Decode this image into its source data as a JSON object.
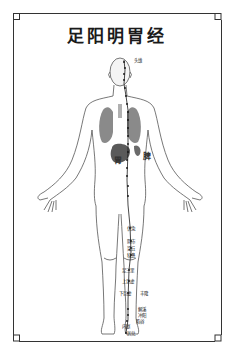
{
  "title": "足阳明胃经",
  "colors": {
    "background": "#ffffff",
    "frame": "#333333",
    "body_outline": "#555555",
    "organs": "#8a8a8a",
    "meridian": "#1a1a1a"
  },
  "organ_labels": {
    "stomach": "胃",
    "spleen": "脾"
  },
  "acupoints": {
    "head": [
      {
        "name": "头维",
        "x": 134,
        "y": 58
      }
    ],
    "leg": [
      {
        "name": "伏兔",
        "x": 127,
        "y": 226
      },
      {
        "name": "阴市",
        "x": 127,
        "y": 239
      },
      {
        "name": "梁丘",
        "x": 127,
        "y": 246
      },
      {
        "name": "犊鼻",
        "x": 127,
        "y": 253
      },
      {
        "name": "足三里",
        "x": 122,
        "y": 268
      },
      {
        "name": "上巨虚",
        "x": 122,
        "y": 279
      },
      {
        "name": "下巨虚",
        "x": 119,
        "y": 291
      },
      {
        "name": "丰隆",
        "x": 140,
        "y": 291
      },
      {
        "name": "解溪",
        "x": 138,
        "y": 307
      },
      {
        "name": "冲阳",
        "x": 138,
        "y": 313
      },
      {
        "name": "陷谷",
        "x": 136,
        "y": 319
      },
      {
        "name": "内庭",
        "x": 122,
        "y": 324
      },
      {
        "name": "厉兑",
        "x": 127,
        "y": 331
      }
    ]
  }
}
